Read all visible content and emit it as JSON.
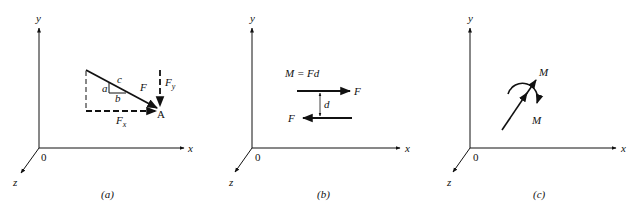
{
  "figure": {
    "panels": [
      {
        "id": "a",
        "caption": "(a)",
        "axes": {
          "x": "x",
          "y": "y",
          "z": "z",
          "origin": "0"
        },
        "labels": {
          "side_a": "a",
          "side_b": "b",
          "side_c": "c",
          "force": "F",
          "fx": "F",
          "fx_sub": "x",
          "fy": "F",
          "fy_sub": "y",
          "point": "A"
        }
      },
      {
        "id": "b",
        "caption": "(b)",
        "axes": {
          "x": "x",
          "y": "y",
          "z": "z",
          "origin": "0"
        },
        "labels": {
          "equation": "M = Fd",
          "force_top": "F",
          "force_bottom": "F",
          "distance": "d"
        }
      },
      {
        "id": "c",
        "caption": "(c)",
        "axes": {
          "x": "x",
          "y": "y",
          "z": "z",
          "origin": "0"
        },
        "labels": {
          "moment_top": "M",
          "moment_bottom": "M"
        }
      }
    ]
  },
  "colors": {
    "ink": "#111111",
    "background": "#ffffff"
  }
}
